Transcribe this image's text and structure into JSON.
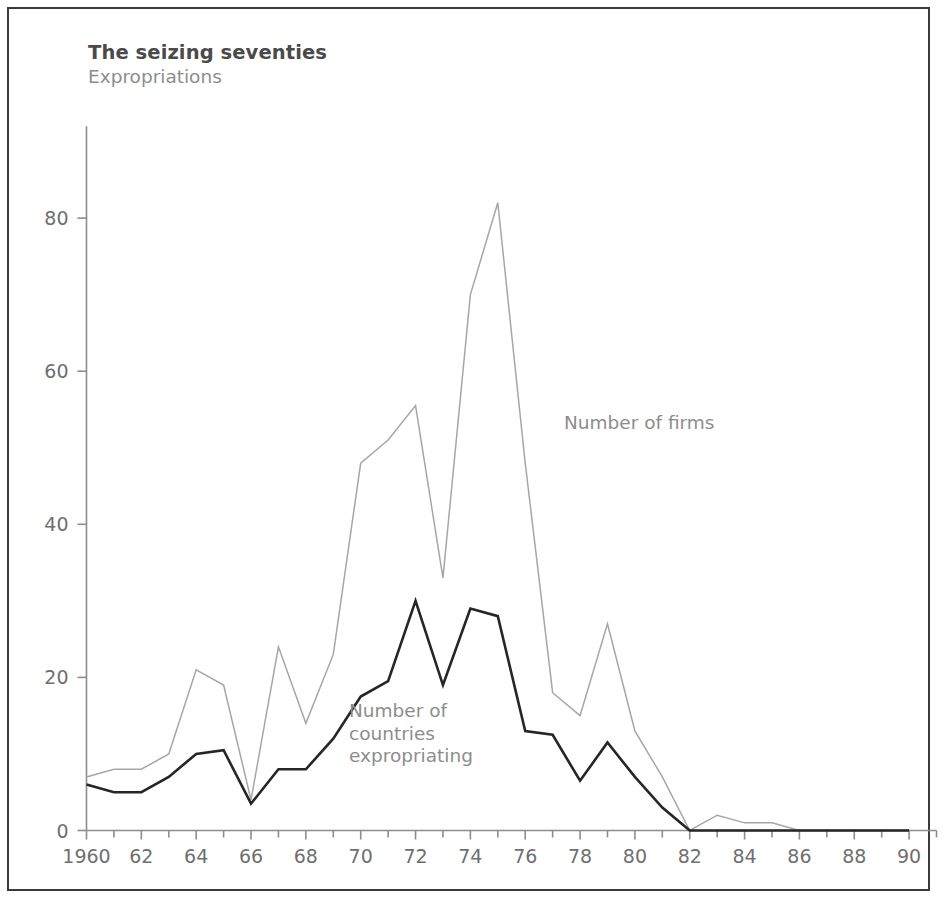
{
  "title": "The seizing seventies",
  "subtitle": "Expropriations",
  "colors": {
    "frame": "#3a3a3a",
    "axis": "#8d8d8d",
    "firms_line": "#a6a6a6",
    "countries_line": "#262626",
    "tick_text": "#6f6f6f",
    "title_text": "#4a4a4a",
    "subtitle_text": "#8d8d8d",
    "series_label_text": "#8d8d8d",
    "background": "#ffffff"
  },
  "series_labels": {
    "firms": "Number of firms",
    "countries_line1": "Number of",
    "countries_line2": "countries",
    "countries_line3": "expropriating"
  },
  "axes": {
    "y_ticks": [
      "0",
      "20",
      "40",
      "60",
      "80"
    ],
    "y_tick_values": [
      0,
      20,
      40,
      60,
      80
    ],
    "x_ticks": [
      "1960",
      "62",
      "64",
      "66",
      "68",
      "70",
      "72",
      "74",
      "76",
      "78",
      "80",
      "82",
      "84",
      "86",
      "88",
      "90"
    ],
    "x_tick_values": [
      1960,
      1962,
      1964,
      1966,
      1968,
      1970,
      1972,
      1974,
      1976,
      1978,
      1980,
      1982,
      1984,
      1986,
      1988,
      1990
    ]
  },
  "chart_data": {
    "type": "line",
    "title": "The seizing seventies",
    "subtitle": "Expropriations",
    "xlabel": "",
    "ylabel": "",
    "xlim": [
      1960,
      1991
    ],
    "ylim": [
      0,
      92
    ],
    "grid": false,
    "legend": "inline-annotations",
    "x": [
      1960,
      1961,
      1962,
      1963,
      1964,
      1965,
      1966,
      1967,
      1968,
      1969,
      1970,
      1971,
      1972,
      1973,
      1974,
      1975,
      1976,
      1977,
      1978,
      1979,
      1980,
      1981,
      1982,
      1983,
      1984,
      1985,
      1986,
      1987,
      1988,
      1989,
      1990
    ],
    "series": [
      {
        "name": "Number of firms",
        "color": "#a6a6a6",
        "values": [
          7,
          8,
          8,
          10,
          21,
          19,
          4,
          24,
          14,
          23,
          48,
          51,
          55.5,
          33,
          70,
          82,
          48,
          18,
          15,
          27,
          13,
          7,
          0,
          2,
          1,
          1,
          0,
          0,
          0,
          0,
          0
        ]
      },
      {
        "name": "Number of countries expropriating",
        "color": "#262626",
        "values": [
          6,
          5,
          5,
          7,
          10,
          10.5,
          3.5,
          8,
          8,
          12,
          17.5,
          19.5,
          30,
          19,
          29,
          28,
          13,
          12.5,
          6.5,
          11.5,
          7,
          3,
          0,
          0,
          0,
          0,
          0,
          0,
          0,
          0,
          0
        ]
      }
    ]
  }
}
